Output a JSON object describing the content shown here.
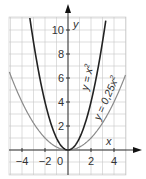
{
  "chart_data": {
    "type": "line",
    "title": "",
    "xlabel": "x",
    "ylabel": "y",
    "xlim": [
      -5,
      5
    ],
    "ylim": [
      -2,
      11
    ],
    "grid": true,
    "xticks": [
      -4,
      -2,
      0,
      2,
      4
    ],
    "xtick_labels": [
      "−4",
      "−2",
      "0",
      "2",
      "4"
    ],
    "yticks": [
      2,
      4,
      6,
      8,
      10
    ],
    "ytick_labels": [
      "2",
      "4",
      "6",
      "8",
      "10"
    ],
    "series": [
      {
        "name": "y = x²",
        "formula": "x^2",
        "color": "#222222",
        "x": [
          -3.3,
          -3,
          -2,
          -1,
          0,
          1,
          2,
          3,
          3.3
        ],
        "y": [
          10.9,
          9,
          4,
          1,
          0,
          1,
          4,
          9,
          10.9
        ]
      },
      {
        "name": "y = 0,25x²",
        "formula": "0.25*x^2",
        "color": "#888888",
        "x": [
          -5,
          -4,
          -2,
          0,
          2,
          4,
          5
        ],
        "y": [
          6.25,
          4,
          1,
          0,
          1,
          4,
          6.25
        ]
      }
    ],
    "annotations": [
      "y = x²",
      "y = 0,25x²"
    ]
  },
  "labels": {
    "x_axis": "x",
    "y_axis": "y",
    "curve1": "y = x",
    "curve1_exp": "2",
    "curve2": "y = 0,25x",
    "curve2_exp": "2"
  }
}
